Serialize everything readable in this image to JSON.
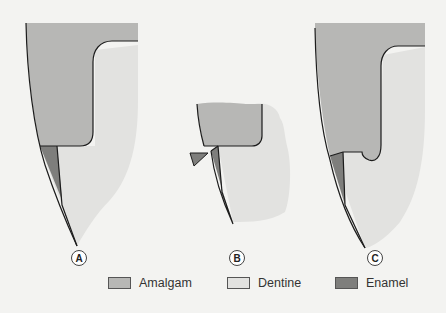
{
  "figure": {
    "panels": [
      {
        "id": "A",
        "label": "A"
      },
      {
        "id": "B",
        "label": "B"
      },
      {
        "id": "C",
        "label": "C"
      }
    ],
    "legend": [
      {
        "name": "Amalgam",
        "color": "#b7b7b5"
      },
      {
        "name": "Dentine",
        "color": "#e2e2e0"
      },
      {
        "name": "Enamel",
        "color": "#7e7e7c"
      }
    ],
    "colors": {
      "background": "#f3f3f1",
      "amalgam": "#b7b7b5",
      "dentine": "#e2e2e0",
      "enamel": "#7e7e7c",
      "outline": "#1c1c1c"
    }
  }
}
